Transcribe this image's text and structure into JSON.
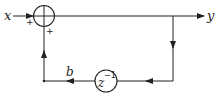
{
  "diagram": {
    "type": "block-diagram",
    "title": "",
    "input_label": "x",
    "output_label": "y",
    "gain_label": "b",
    "delay_label_base": "z",
    "delay_label_exp": "−1",
    "sum_sign_left": "+",
    "sum_sign_bottom": "+",
    "nodes": [
      {
        "id": "sum",
        "kind": "summing-junction",
        "symbol": "⊕"
      },
      {
        "id": "delay",
        "kind": "unit-delay",
        "label": "z^-1"
      }
    ],
    "edges": [
      {
        "from": "x",
        "to": "sum",
        "sign": "+"
      },
      {
        "from": "sum",
        "to": "y"
      },
      {
        "from": "y",
        "to": "delay"
      },
      {
        "from": "delay",
        "to": "sum",
        "gain": "b",
        "sign": "+"
      }
    ],
    "colors": {
      "stroke": "#222222",
      "background": "#ffffff"
    }
  }
}
